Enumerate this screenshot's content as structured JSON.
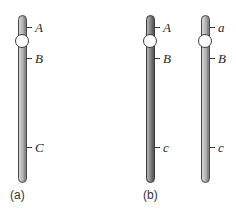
{
  "figure": {
    "background_color": "#ffffff",
    "tick_color": "#3a3a3a",
    "label_color": "#1f1f1f",
    "centromere_color": "#ffffff",
    "panel_a": {
      "label": "(a)",
      "chromosomes": [
        {
          "shade": "light",
          "fill_color": "#b3b3b3",
          "outline_color": "#4a4a4a",
          "centromere": "white-circle",
          "loci": {
            "top": "A",
            "middle": "B",
            "bottom": "C"
          }
        }
      ]
    },
    "panel_b": {
      "label": "(b)",
      "chromosomes": [
        {
          "shade": "dark",
          "fill_color": "#7d7d7d",
          "outline_color": "#3b3b3b",
          "centromere": "white-circle",
          "loci": {
            "top": "A",
            "middle": "B",
            "bottom": "c"
          }
        },
        {
          "shade": "light",
          "fill_color": "#b3b3b3",
          "outline_color": "#4a4a4a",
          "centromere": "white-circle",
          "loci": {
            "top": "a",
            "middle": "B",
            "bottom": "c"
          }
        }
      ]
    }
  }
}
